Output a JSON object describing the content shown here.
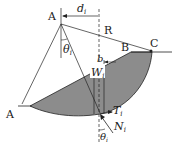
{
  "diagram": {
    "labels": {
      "center": "A",
      "toe": "A",
      "crest_b": "B",
      "crest_c": "C",
      "radius": "R",
      "distance": "d",
      "distance_sub": "i",
      "angle_top": "θ",
      "angle_top_sub": "i",
      "slice_width": "b",
      "weight": "W",
      "weight_sub": "i",
      "tangential": "T",
      "tangential_sub": "i",
      "normal": "N",
      "normal_sub": "i",
      "angle_bottom": "θ",
      "angle_bottom_sub": "i"
    },
    "colors": {
      "soil_fill": "#8c8c8c",
      "line": "#222222",
      "background": "#ffffff"
    }
  }
}
